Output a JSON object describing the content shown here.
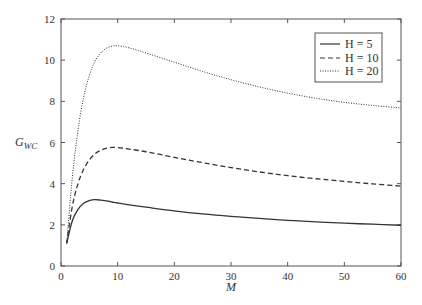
{
  "chart_data": {
    "type": "line",
    "title": "",
    "xlabel": "M",
    "ylabel": "G",
    "ylabel_subscript": "WC",
    "xlim": [
      0,
      60
    ],
    "ylim": [
      0,
      12
    ],
    "xticks": [
      "0",
      "10",
      "20",
      "30",
      "40",
      "50",
      "60"
    ],
    "yticks": [
      "0",
      "2",
      "4",
      "6",
      "8",
      "10",
      "12"
    ],
    "grid": false,
    "legend_position": "upper right",
    "x": [
      1,
      2,
      3,
      4,
      5,
      6,
      7,
      8,
      9,
      10,
      12,
      15,
      20,
      25,
      30,
      35,
      40,
      45,
      50,
      55,
      60
    ],
    "series": [
      {
        "name": "H = 5",
        "style": "solid",
        "values": [
          1.1,
          2.2,
          2.75,
          3.05,
          3.18,
          3.22,
          3.2,
          3.16,
          3.11,
          3.06,
          2.97,
          2.86,
          2.68,
          2.53,
          2.41,
          2.31,
          2.22,
          2.14,
          2.08,
          2.03,
          1.98
        ]
      },
      {
        "name": "H = 10",
        "style": "dashed",
        "values": [
          1.1,
          2.9,
          4.0,
          4.7,
          5.15,
          5.45,
          5.62,
          5.72,
          5.76,
          5.75,
          5.68,
          5.55,
          5.28,
          5.02,
          4.78,
          4.57,
          4.39,
          4.24,
          4.11,
          3.99,
          3.88
        ]
      },
      {
        "name": "H = 20",
        "style": "dotted",
        "values": [
          1.1,
          4.3,
          6.6,
          8.2,
          9.25,
          9.95,
          10.35,
          10.58,
          10.68,
          10.7,
          10.6,
          10.35,
          9.9,
          9.45,
          9.05,
          8.7,
          8.4,
          8.15,
          7.95,
          7.8,
          7.68
        ]
      }
    ]
  },
  "legend": {
    "items": [
      {
        "label": "H = 5"
      },
      {
        "label": "H = 10"
      },
      {
        "label": "H = 20"
      }
    ]
  },
  "axes": {
    "xlabel": "M",
    "ylabel_main": "G",
    "ylabel_sub": "WC",
    "xticks": [
      "0",
      "10",
      "20",
      "30",
      "40",
      "50",
      "60"
    ],
    "yticks": [
      "0",
      "2",
      "4",
      "6",
      "8",
      "10",
      "12"
    ]
  }
}
